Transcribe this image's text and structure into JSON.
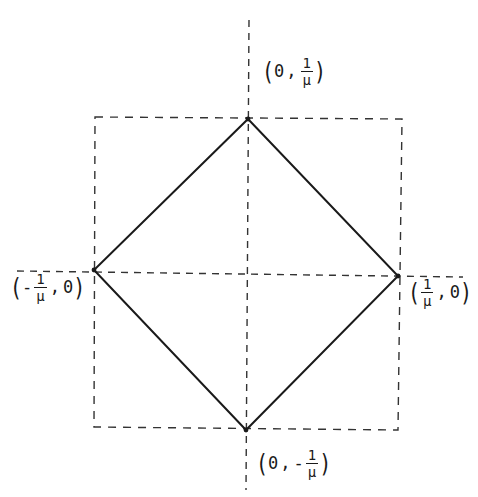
{
  "diagram": {
    "axes": {
      "horizontal": {
        "x1": 17,
        "y1": 271,
        "x2": 463,
        "y2": 277
      },
      "vertical": {
        "x1": 249,
        "y1": 20,
        "x2": 246,
        "y2": 490
      }
    },
    "bounding_square": {
      "top_left": [
        95,
        117
      ],
      "top_right": [
        402,
        119
      ],
      "bottom_right": [
        398,
        430
      ],
      "bottom_left": [
        94,
        427
      ]
    },
    "diamond": {
      "top": [
        248,
        119
      ],
      "right": [
        398,
        276
      ],
      "bottom": [
        246,
        430
      ],
      "left": [
        94,
        270
      ]
    },
    "labels": {
      "top": {
        "open": "(",
        "first": "0",
        "comma": ",",
        "sign": "",
        "numerator": "1",
        "denominator": "μ",
        "close": ")"
      },
      "bottom": {
        "open": "(",
        "first": "0",
        "comma": ",",
        "sign": "-",
        "numerator": "1",
        "denominator": "μ",
        "close": ")"
      },
      "left": {
        "open": "(",
        "sign": "-",
        "numerator": "1",
        "denominator": "μ",
        "comma": ",",
        "second": "0",
        "close": ")"
      },
      "right": {
        "open": "(",
        "sign": "",
        "numerator": "1",
        "denominator": "μ",
        "comma": ",",
        "second": "0",
        "close": ")"
      }
    },
    "colors": {
      "background": "#ffffff",
      "stroke": "#1a1a1a",
      "dashed": "#333333"
    }
  }
}
